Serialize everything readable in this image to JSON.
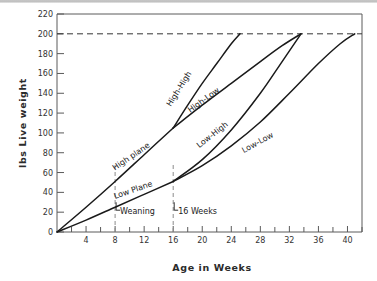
{
  "chart_data": {
    "type": "line",
    "title": "",
    "xlabel": "Age in Weeks",
    "ylabel": "lbs   Live weight",
    "ylabel_parts": {
      "unit": "lbs",
      "name": "Live weight"
    },
    "xlim": [
      0,
      42
    ],
    "ylim": [
      0,
      220
    ],
    "grid": false,
    "legend_position": "inline-curve-labels",
    "x_major_ticks": [
      4,
      8,
      12,
      16,
      20,
      24,
      28,
      32,
      36,
      40
    ],
    "x_minor_ticks": [
      2,
      6,
      10,
      14,
      18,
      22,
      26,
      30,
      34,
      38,
      42
    ],
    "x_tick_labels": [
      "4",
      "8",
      "12",
      "16",
      "20",
      "24",
      "28",
      "32",
      "36",
      "40"
    ],
    "y_ticks": [
      0,
      20,
      40,
      60,
      80,
      100,
      120,
      140,
      160,
      180,
      200,
      220
    ],
    "y_tick_labels": [
      "0",
      "20",
      "40",
      "60",
      "80",
      "100",
      "120",
      "140",
      "160",
      "180",
      "200",
      "220"
    ],
    "target_weight_line": {
      "value": 200,
      "style": "dashed",
      "label": ""
    },
    "event_lines": [
      {
        "x": 8,
        "label": "Weaning",
        "style": "dashed"
      },
      {
        "x": 16,
        "label": "16 Weeks",
        "style": "dashed"
      }
    ],
    "series": [
      {
        "name": "High plane",
        "label": "High plane",
        "label_x": 10.4,
        "label_y": 74,
        "label_rotation": -34,
        "points": [
          [
            0,
            0
          ],
          [
            4,
            25
          ],
          [
            8,
            51
          ],
          [
            12,
            78
          ],
          [
            16,
            105
          ]
        ]
      },
      {
        "name": "Low Plane",
        "label": "Low Plane",
        "label_x": 10.6,
        "label_y": 40,
        "label_rotation": -19,
        "points": [
          [
            0,
            0
          ],
          [
            4,
            12
          ],
          [
            8,
            25
          ],
          [
            12,
            38
          ],
          [
            16,
            51
          ]
        ]
      },
      {
        "name": "High-High",
        "label": "High-High",
        "label_x": 17.1,
        "label_y": 143,
        "label_rotation": -58,
        "points": [
          [
            16,
            105
          ],
          [
            18,
            128
          ],
          [
            20,
            150
          ],
          [
            22,
            170
          ],
          [
            24,
            190
          ],
          [
            25.2,
            200
          ]
        ]
      },
      {
        "name": "High-Low",
        "label": "High-Low",
        "label_x": 20.4,
        "label_y": 131,
        "label_rotation": -36,
        "points": [
          [
            16,
            105
          ],
          [
            20,
            128
          ],
          [
            24,
            150
          ],
          [
            28,
            172
          ],
          [
            31,
            188
          ],
          [
            33.6,
            200
          ]
        ]
      },
      {
        "name": "Low-High",
        "label": "Low-High",
        "label_x": 21.6,
        "label_y": 96,
        "label_rotation": -38,
        "points": [
          [
            16,
            51
          ],
          [
            20,
            73
          ],
          [
            24,
            103
          ],
          [
            28,
            140
          ],
          [
            31,
            172
          ],
          [
            33.6,
            200
          ]
        ]
      },
      {
        "name": "Low-Low",
        "label": "Low-Low",
        "label_x": 27.8,
        "label_y": 88,
        "label_rotation": -29,
        "points": [
          [
            16,
            51
          ],
          [
            20,
            67
          ],
          [
            24,
            87
          ],
          [
            28,
            111
          ],
          [
            32,
            140
          ],
          [
            36,
            170
          ],
          [
            39,
            190
          ],
          [
            41,
            200
          ]
        ]
      }
    ]
  }
}
